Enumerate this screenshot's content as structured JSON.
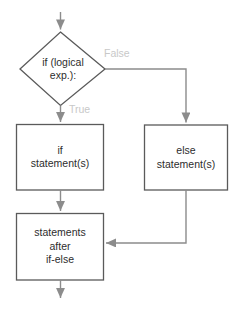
{
  "diagram": {
    "type": "flowchart",
    "colors": {
      "background": "#ffffff",
      "shape_stroke": "#5a5a5a",
      "connector_stroke": "#8c8c8c",
      "node_text": "#2d2d2d",
      "edge_label_text": "#c8c8c8"
    },
    "nodes": [
      {
        "id": "decision",
        "shape": "diamond",
        "lines": [
          "if (logical",
          "exp.):"
        ]
      },
      {
        "id": "if-branch",
        "shape": "rectangle",
        "lines": [
          "if",
          "statement(s)"
        ]
      },
      {
        "id": "else-branch",
        "shape": "rectangle",
        "lines": [
          "else",
          "statement(s)"
        ]
      },
      {
        "id": "merge",
        "shape": "rectangle",
        "lines": [
          "statements",
          "after",
          "if-else"
        ]
      }
    ],
    "edge_labels": {
      "false_branch": "False",
      "true_branch": "True"
    }
  }
}
